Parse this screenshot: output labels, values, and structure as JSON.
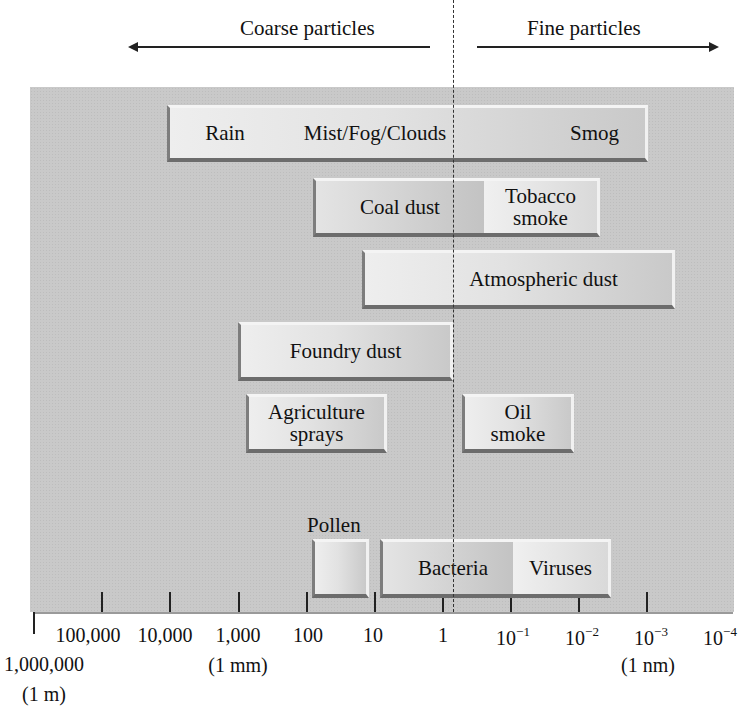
{
  "header": {
    "coarse_label": "Coarse particles",
    "fine_label": "Fine particles",
    "coarse_arrow_icon": "arrow-left-icon",
    "fine_arrow_icon": "arrow-right-icon"
  },
  "axis": {
    "unit_note": "particle diameter (μm), logarithmic scale",
    "ticks": [
      {
        "label": "1,000,000",
        "sub": "(1 m)",
        "x": 33
      },
      {
        "label": "100,000",
        "x": 101
      },
      {
        "label": "10,000",
        "x": 169
      },
      {
        "label": "1,000",
        "sub": "(1 mm)",
        "x": 238
      },
      {
        "label": "100",
        "x": 306
      },
      {
        "label": "10",
        "x": 374
      },
      {
        "label": "1",
        "x": 442
      },
      {
        "label": "10",
        "exp": "−1",
        "x": 510
      },
      {
        "label": "10",
        "exp": "−2",
        "x": 578
      },
      {
        "label": "10",
        "exp": "−3",
        "sub": "(1 nm)",
        "x": 646
      },
      {
        "label": "10",
        "exp": "−4",
        "x": 714
      }
    ]
  },
  "categories": [
    {
      "row": 1,
      "segments": [
        "Rain",
        "Mist/Fog/Clouds",
        "Smog"
      ]
    },
    {
      "row": 2,
      "segments": [
        "Coal dust",
        "Tobacco smoke"
      ]
    },
    {
      "row": 3,
      "segments": [
        "Atmospheric dust"
      ]
    },
    {
      "row": 4,
      "segments": [
        "Foundry dust"
      ]
    },
    {
      "row": 5,
      "segments": [
        "Agriculture sprays",
        "Oil smoke"
      ]
    },
    {
      "row": 6,
      "segments": [
        "Pollen",
        "Bacteria",
        "Viruses"
      ]
    }
  ],
  "labels": {
    "rain": "Rain",
    "mist": "Mist/Fog/Clouds",
    "smog": "Smog",
    "coal": "Coal dust",
    "tobacco_1": "Tobacco",
    "tobacco_2": "smoke",
    "atmospheric": "Atmospheric dust",
    "foundry": "Foundry dust",
    "agri_1": "Agriculture",
    "agri_2": "sprays",
    "oil_1": "Oil",
    "oil_2": "smoke",
    "pollen": "Pollen",
    "bacteria": "Bacteria",
    "viruses": "Viruses"
  },
  "colors": {
    "panel_bg": "#c9c9c9",
    "box_light": "#eeeeee",
    "box_dark": "#c3c3c3",
    "text": "#111111"
  }
}
